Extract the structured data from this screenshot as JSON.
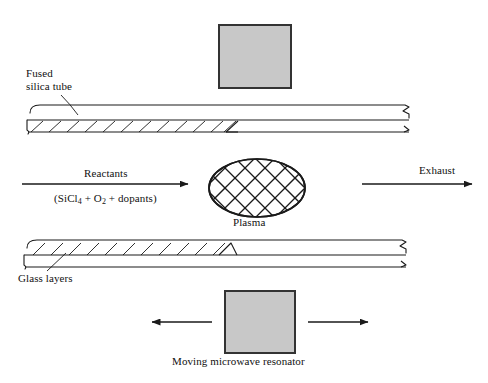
{
  "figure": {
    "background_color": "#ffffff",
    "line_color": "#1a1a1a",
    "resonator_fill": "#c8c8c8",
    "resonator_stroke": "#333333"
  },
  "labels": {
    "fused_silica_tube": "Fused\nsilica tube",
    "fused_silica_tube_line1": "Fused",
    "fused_silica_tube_line2": "silica tube",
    "glass_layers": "Glass layers",
    "reactants": "Reactants",
    "reactants_formula_prefix": "(SiCl",
    "reactants_formula_sub1": "4",
    "reactants_formula_mid": " + O",
    "reactants_formula_sub2": "2",
    "reactants_formula_suffix": " + dopants)",
    "exhaust": "Exhaust",
    "plasma": "Plasma",
    "moving_microwave_resonator": "Moving microwave  resonator"
  },
  "elements": {
    "top_resonator": {
      "name": "microwave-resonator-top",
      "x": 219,
      "y": 25,
      "width": 72,
      "height": 63
    },
    "bottom_resonator": {
      "name": "microwave-resonator-bottom",
      "x": 225,
      "y": 291,
      "width": 70,
      "height": 62
    },
    "plasma_ellipse": {
      "cx": 257,
      "cy": 188,
      "rx": 48,
      "ry": 29
    },
    "top_tube": {
      "x": 25,
      "y": 104,
      "width": 390,
      "height": 24
    },
    "bottom_tube": {
      "x": 22,
      "y": 239,
      "width": 390,
      "height": 24
    },
    "reactants_arrow": {
      "x1": 22,
      "y1": 184,
      "x2": 188,
      "y2": 184,
      "direction": "right"
    },
    "exhaust_arrow": {
      "x1": 362,
      "y1": 184,
      "x2": 472,
      "y2": 184,
      "direction": "right"
    },
    "resonator_arrow_left": {
      "x1": 212,
      "y1": 322,
      "x2": 152,
      "y2": 322,
      "direction": "left"
    },
    "resonator_arrow_right": {
      "x1": 308,
      "y1": 322,
      "x2": 368,
      "y2": 322,
      "direction": "right"
    }
  }
}
